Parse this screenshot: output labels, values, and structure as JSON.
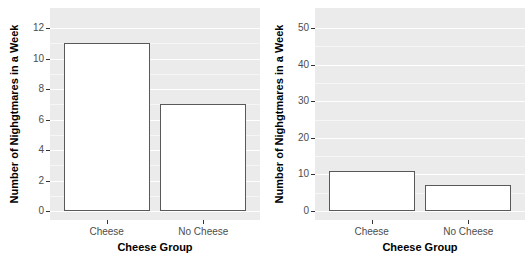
{
  "colors": {
    "figure_bg": "#ffffff",
    "panel_bg": "#ebebeb",
    "grid_major": "#ffffff",
    "grid_minor": "rgba(255,255,255,0.55)",
    "bar_fill": "#ffffff",
    "bar_border": "#595959",
    "tick_mark": "#333333",
    "tick_label": "#4d4d4d",
    "axis_title": "#000000"
  },
  "chart_data": [
    {
      "type": "bar",
      "title": "",
      "categories": [
        "Cheese",
        "No Cheese"
      ],
      "values": [
        11,
        7
      ],
      "xlabel": "Cheese Group",
      "ylabel": "Number of Nighgtmares in a Week",
      "ylim": [
        0,
        12
      ],
      "yticks": [
        0,
        2,
        4,
        6,
        8,
        10,
        12
      ],
      "yticks_minor": [
        1,
        3,
        5,
        7,
        9,
        11
      ],
      "grid": true,
      "legend_position": "none"
    },
    {
      "type": "bar",
      "title": "",
      "categories": [
        "Cheese",
        "No Cheese"
      ],
      "values": [
        11,
        7
      ],
      "xlabel": "Cheese Group",
      "ylabel": "Number of Nighgtmares in a Week",
      "ylim": [
        0,
        50
      ],
      "yticks": [
        0,
        10,
        20,
        30,
        40,
        50
      ],
      "yticks_minor": [
        5,
        15,
        25,
        35,
        45
      ],
      "grid": true,
      "legend_position": "none"
    }
  ]
}
